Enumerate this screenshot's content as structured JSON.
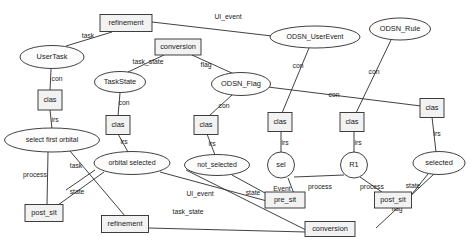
{
  "diagram": {
    "type": "graph-metamodel",
    "background_color": "#ffffff",
    "node_fill_box": "#f2f2f2",
    "node_fill_ellipse": "#fcfcfc",
    "stroke_color": "#2b2b2b",
    "nodes": [
      {
        "id": "refinement_top",
        "label": "refinement",
        "shape": "box",
        "x": 126,
        "y": 23,
        "w": 52,
        "h": 17
      },
      {
        "id": "usertask",
        "label": "UserTask",
        "shape": "ellipse",
        "x": 52,
        "y": 57,
        "w": 64,
        "h": 23
      },
      {
        "id": "conversion_top",
        "label": "conversion",
        "shape": "box",
        "x": 178,
        "y": 47,
        "w": 46,
        "h": 16
      },
      {
        "id": "odsn_userevent",
        "label": "ODSN_UserEvent",
        "shape": "ellipse",
        "x": 315,
        "y": 37,
        "w": 90,
        "h": 22
      },
      {
        "id": "odsn_rule",
        "label": "ODSN_Rule",
        "shape": "ellipse",
        "x": 400,
        "y": 29,
        "w": 61,
        "h": 22
      },
      {
        "id": "taskstate",
        "label": "TaskState",
        "shape": "ellipse",
        "x": 120,
        "y": 82,
        "w": 51,
        "h": 21
      },
      {
        "id": "odsn_flag",
        "label": "ODSN_Flag",
        "shape": "ellipse",
        "x": 241,
        "y": 84,
        "w": 59,
        "h": 23
      },
      {
        "id": "clas_1",
        "label": "clas",
        "shape": "box",
        "x": 50,
        "y": 100,
        "w": 24,
        "h": 20
      },
      {
        "id": "clas_2",
        "label": "clas",
        "shape": "box",
        "x": 118,
        "y": 125,
        "w": 24,
        "h": 19
      },
      {
        "id": "clas_3",
        "label": "clas",
        "shape": "box",
        "x": 206,
        "y": 125,
        "w": 24,
        "h": 19
      },
      {
        "id": "clas_4",
        "label": "clas",
        "shape": "box",
        "x": 280,
        "y": 122,
        "w": 24,
        "h": 19
      },
      {
        "id": "clas_5",
        "label": "clas",
        "shape": "box",
        "x": 352,
        "y": 122,
        "w": 24,
        "h": 19
      },
      {
        "id": "clas_6",
        "label": "clas",
        "shape": "box",
        "x": 432,
        "y": 108,
        "w": 24,
        "h": 19
      },
      {
        "id": "select_first",
        "label": "select first orbital",
        "shape": "ellipse",
        "x": 52,
        "y": 140,
        "w": 95,
        "h": 24
      },
      {
        "id": "orbital_selected",
        "label": "orbital selected",
        "shape": "ellipse",
        "x": 132,
        "y": 163,
        "w": 76,
        "h": 23
      },
      {
        "id": "not_selected",
        "label": "not_selected",
        "shape": "ellipse",
        "x": 217,
        "y": 165,
        "w": 65,
        "h": 21
      },
      {
        "id": "sel",
        "label": "sel",
        "shape": "circle",
        "x": 281,
        "y": 165,
        "w": 27,
        "h": 26
      },
      {
        "id": "r1",
        "label": "R1",
        "shape": "circle",
        "x": 354,
        "y": 165,
        "w": 27,
        "h": 26
      },
      {
        "id": "selected",
        "label": "selected",
        "shape": "ellipse",
        "x": 439,
        "y": 163,
        "w": 52,
        "h": 23
      },
      {
        "id": "post_sit_left",
        "label": "post_sit",
        "shape": "box",
        "x": 44,
        "y": 213,
        "w": 38,
        "h": 17
      },
      {
        "id": "refinement_bot",
        "label": "refinement",
        "shape": "box",
        "x": 125,
        "y": 224,
        "w": 47,
        "h": 17
      },
      {
        "id": "pre_sit",
        "label": "pre_sit",
        "shape": "box",
        "x": 285,
        "y": 200,
        "w": 40,
        "h": 16
      },
      {
        "id": "post_sit_right",
        "label": "post_sit",
        "shape": "box",
        "x": 393,
        "y": 200,
        "w": 37,
        "h": 16
      },
      {
        "id": "conversion_bot",
        "label": "conversion",
        "shape": "box",
        "x": 330,
        "y": 229,
        "w": 50,
        "h": 15
      }
    ],
    "edges": [
      {
        "from": "refinement_top",
        "to": "usertask",
        "label": "task",
        "lx": 88,
        "ly": 36,
        "x1": 112,
        "y1": 32,
        "x2": 66,
        "y2": 46
      },
      {
        "from": "refinement_top",
        "to": "odsn_userevent",
        "label": "UI_event",
        "lx": 228,
        "ly": 17,
        "x1": 152,
        "y1": 22,
        "x2": 272,
        "y2": 36
      },
      {
        "from": "conversion_top",
        "to": "taskstate",
        "label": "task_state",
        "lx": 148,
        "ly": 62,
        "x1": 164,
        "y1": 55,
        "x2": 128,
        "y2": 72
      },
      {
        "from": "conversion_top",
        "to": "odsn_flag",
        "label": "flag",
        "lx": 206,
        "ly": 65,
        "x1": 192,
        "y1": 55,
        "x2": 234,
        "y2": 74
      },
      {
        "from": "usertask",
        "to": "clas_1",
        "label": "con",
        "lx": 57,
        "ly": 79,
        "x1": 51,
        "y1": 69,
        "x2": 50,
        "y2": 91
      },
      {
        "from": "taskstate",
        "to": "clas_2",
        "label": "con",
        "lx": 124,
        "ly": 103,
        "x1": 120,
        "y1": 93,
        "x2": 118,
        "y2": 116
      },
      {
        "from": "odsn_flag",
        "to": "clas_3",
        "label": "con",
        "lx": 224,
        "ly": 106,
        "x1": 232,
        "y1": 95,
        "x2": 209,
        "y2": 116
      },
      {
        "from": "odsn_userevent",
        "to": "clas_4",
        "label": "con",
        "lx": 298,
        "ly": 66,
        "x1": 309,
        "y1": 48,
        "x2": 282,
        "y2": 113
      },
      {
        "from": "odsn_rule",
        "to": "clas_5",
        "label": "con",
        "lx": 374,
        "ly": 72,
        "x1": 391,
        "y1": 40,
        "x2": 356,
        "y2": 113
      },
      {
        "from": "odsn_flag",
        "to": "clas_6",
        "label": "con",
        "lx": 334,
        "ly": 95,
        "x1": 268,
        "y1": 87,
        "x2": 421,
        "y2": 106
      },
      {
        "from": "clas_1",
        "to": "select_first",
        "label": "irs",
        "lx": 55,
        "ly": 120,
        "x1": 50,
        "y1": 110,
        "x2": 52,
        "y2": 129
      },
      {
        "from": "clas_2",
        "to": "orbital_selected",
        "label": "irs",
        "lx": 124,
        "ly": 142,
        "x1": 118,
        "y1": 134,
        "x2": 128,
        "y2": 152
      },
      {
        "from": "clas_3",
        "to": "not_selected",
        "label": "irs",
        "lx": 212,
        "ly": 144,
        "x1": 207,
        "y1": 134,
        "x2": 215,
        "y2": 155
      },
      {
        "from": "clas_4",
        "to": "sel",
        "label": "irs",
        "lx": 285,
        "ly": 143,
        "x1": 281,
        "y1": 131,
        "x2": 281,
        "y2": 153
      },
      {
        "from": "clas_5",
        "to": "r1",
        "label": "irs",
        "lx": 358,
        "ly": 143,
        "x1": 354,
        "y1": 131,
        "x2": 354,
        "y2": 153
      },
      {
        "from": "clas_6",
        "to": "selected",
        "label": "irs",
        "lx": 437,
        "ly": 134,
        "x1": 432,
        "y1": 117,
        "x2": 436,
        "y2": 152
      },
      {
        "from": "select_first",
        "to": "post_sit_left",
        "label": "process",
        "lx": 35,
        "ly": 175,
        "x1": 48,
        "y1": 152,
        "x2": 47,
        "y2": 205
      },
      {
        "from": "select_first",
        "to": "refinement_bot",
        "label": "task",
        "lx": 76,
        "ly": 166,
        "x1": 70,
        "y1": 151,
        "x2": 125,
        "y2": 216
      },
      {
        "from": "orbital_selected",
        "to": "post_sit_left",
        "label": "state",
        "lx": 77,
        "ly": 192,
        "x1": 104,
        "y1": 172,
        "x2": 58,
        "y2": 205
      },
      {
        "from": "orbital_selected",
        "to": "pre_sit",
        "label": "UI_event",
        "lx": 200,
        "ly": 194,
        "x1": 160,
        "y1": 172,
        "x2": 278,
        "y2": 204
      },
      {
        "from": "not_selected",
        "to": "pre_sit",
        "label": "state",
        "lx": 253,
        "ly": 193,
        "x1": 232,
        "y1": 175,
        "x2": 276,
        "y2": 199
      },
      {
        "from": "not_selected",
        "to": "conversion_bot",
        "label": "task_state",
        "lx": 188,
        "ly": 212,
        "x1": 186,
        "y1": 170,
        "x2": 306,
        "y2": 230
      },
      {
        "from": "sel",
        "to": "pre_sit",
        "label": "Event",
        "lx": 282,
        "ly": 189,
        "x1": 288,
        "y1": 178,
        "x2": 296,
        "y2": 199
      },
      {
        "from": "sel",
        "to": "r1",
        "label": "process",
        "lx": 320,
        "ly": 187,
        "x1": 294,
        "y1": 177,
        "x2": 344,
        "y2": 175
      },
      {
        "from": "r1",
        "to": "post_sit_right",
        "label": "process",
        "lx": 372,
        "ly": 187,
        "x1": 360,
        "y1": 177,
        "x2": 392,
        "y2": 199
      },
      {
        "from": "selected",
        "to": "post_sit_right",
        "label": "state",
        "lx": 413,
        "ly": 186,
        "x1": 428,
        "y1": 174,
        "x2": 408,
        "y2": 199
      },
      {
        "from": "selected",
        "to": "conversion_bot",
        "label": "flag",
        "lx": 397,
        "ly": 209,
        "x1": 434,
        "y1": 174,
        "x2": 376,
        "y2": 228
      },
      {
        "from": "refinement_bot",
        "to": "conversion_bot",
        "label": "",
        "lx": 0,
        "ly": 0,
        "x1": 148,
        "y1": 228,
        "x2": 306,
        "y2": 232
      },
      {
        "from": "orbital_selected",
        "to": "select_first_x",
        "label": "",
        "lx": 0,
        "ly": 0,
        "x1": 95,
        "y1": 170,
        "x2": 66,
        "y2": 190
      }
    ]
  }
}
